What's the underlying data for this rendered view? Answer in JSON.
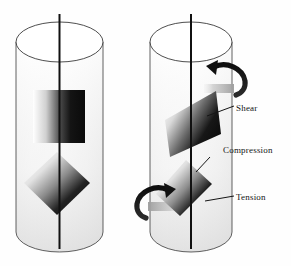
{
  "figure": {
    "background_color": "#fefefe",
    "stroke_color": "#1a1a1a",
    "cylinder_fill_top": "#fbfbfb",
    "cylinder_fill_bottom": "#e9e9e9",
    "element_dark": "#0d0d0d",
    "element_light": "#ffffff",
    "arrow_color": "#1a1a1a",
    "shadow_color": "#b8b8b8"
  },
  "cylinders": [
    {
      "id": "undeformed",
      "name": "left-cylinder-undeformed",
      "left": 16,
      "right": 103,
      "top_center_y": 42,
      "bottom_center_y": 232,
      "ellipse_ry": 20,
      "axis_top": 14,
      "axis_bottom": 249,
      "elements": [
        {
          "name": "square-element",
          "shape": "square",
          "label": "",
          "gradient": "horizontal-light-to-dark"
        },
        {
          "name": "diamond-element",
          "shape": "diamond",
          "label": "",
          "gradient": "diagonal-light-to-dark"
        }
      ],
      "torque_arrows": []
    },
    {
      "id": "deformed",
      "name": "right-cylinder-twisted",
      "left": 150,
      "right": 232,
      "top_center_y": 42,
      "bottom_center_y": 232,
      "ellipse_ry": 20,
      "axis_top": 14,
      "axis_bottom": 249,
      "elements": [
        {
          "name": "sheared-parallelogram-element",
          "shape": "parallelogram",
          "label": "Shear",
          "gradient": "horizontal-light-to-dark"
        },
        {
          "name": "stretched-diamond-element",
          "shape": "rotated-rectangle",
          "label": "Tension",
          "gradient": "diagonal-light-to-dark"
        }
      ],
      "torque_arrows": [
        {
          "name": "torque-arrow-top",
          "position": "top-right",
          "direction": "clockwise"
        },
        {
          "name": "torque-arrow-bottom",
          "position": "bottom-left",
          "direction": "counter-clockwise"
        }
      ]
    }
  ],
  "labels": {
    "shear": "Shear",
    "compression": "Compression",
    "tension": "Tension"
  }
}
